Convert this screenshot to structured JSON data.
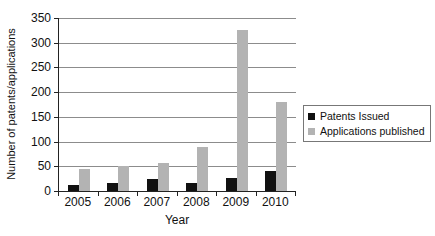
{
  "chart_data": {
    "type": "bar",
    "title": "",
    "xlabel": "Year",
    "ylabel": "Number of patents/applications",
    "categories": [
      "2005",
      "2006",
      "2007",
      "2008",
      "2009",
      "2010"
    ],
    "series": [
      {
        "name": "Patents Issued",
        "color": "#111111",
        "values": [
          13,
          16,
          25,
          17,
          27,
          40
        ]
      },
      {
        "name": "Applications published",
        "color": "#b3b3b3",
        "values": [
          45,
          50,
          57,
          90,
          325,
          180
        ]
      }
    ],
    "ylim": [
      0,
      350
    ],
    "ytick_step": 50,
    "yticks": [
      0,
      50,
      100,
      150,
      200,
      250,
      300,
      350
    ],
    "grid": true,
    "legend_position": "right",
    "colors": {
      "axis": "#222222",
      "gridline": "#8c8c8c",
      "background": "#ffffff"
    }
  }
}
